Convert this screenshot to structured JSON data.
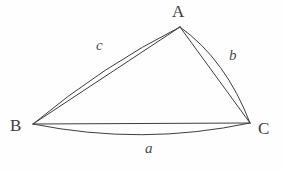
{
  "figure": {
    "kind": "spherical-triangle-diagram",
    "background_color": "#fefefe",
    "stroke_color": "#3d3d3d",
    "stroke_width": 1,
    "width": 283,
    "height": 172
  },
  "vertices": [
    {
      "id": "A",
      "label": "A",
      "x": 180,
      "y": 27
    },
    {
      "id": "B",
      "label": "B",
      "x": 33,
      "y": 124
    },
    {
      "id": "C",
      "label": "C",
      "x": 250,
      "y": 123
    }
  ],
  "sides": [
    {
      "id": "a",
      "label": "a",
      "from": "B",
      "to": "C",
      "chord": "M 33 124 L 250 123",
      "arc": "M 33 124 Q 142 146 250 123",
      "label_x": 145,
      "label_y": 141
    },
    {
      "id": "b",
      "label": "b",
      "from": "A",
      "to": "C",
      "chord": "M 180 27 L 250 123",
      "arc": "M 180 27 Q 226 60 250 123",
      "label_x": 229,
      "label_y": 48
    },
    {
      "id": "c",
      "label": "c",
      "from": "B",
      "to": "A",
      "chord": "M 33 124 L 180 27",
      "arc": "M 33 124 Q 104 65 180 27",
      "label_x": 96,
      "label_y": 38
    }
  ],
  "labels": {
    "vertex_A": "A",
    "vertex_B": "B",
    "vertex_C": "C",
    "side_a": "a",
    "side_b": "b",
    "side_c": "c"
  }
}
